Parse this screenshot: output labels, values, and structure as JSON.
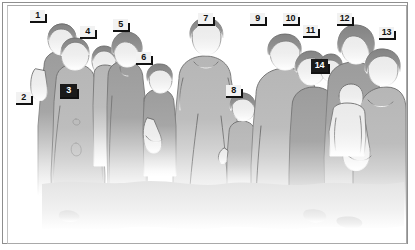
{
  "image": {
    "title": "Group silhouette illustration with numbered callouts",
    "subject": "group-of-people",
    "style": "grayscale-silhouette-line-art",
    "person_count": 14,
    "fade": "figures fade to white toward the bottom of the frame"
  },
  "frame": {
    "outer_border_color": "#8e8e8e",
    "inner_border_color": "#a9a9a9",
    "background_color": "#ffffff"
  },
  "palette": {
    "skin_light": "#e8e8e8",
    "garment_mid": "#b4b4b4",
    "garment_dark": "#9a9a9a",
    "hair_dark": "#7d7d7d",
    "outline": "#5f5f5f",
    "label_plate_light": "#f2f2f2",
    "label_plate_dark": "#1a1a1a",
    "label_text_light": "#111111",
    "label_text_dark": "#ffffff"
  },
  "callouts": [
    {
      "id": 1,
      "label": "1",
      "style": "light",
      "x": 30,
      "y": 10,
      "target": "adult standing at far left, bald/short hair"
    },
    {
      "id": 2,
      "label": "2",
      "style": "light",
      "x": 16,
      "y": 92,
      "target": "torso of far-left adult"
    },
    {
      "id": 3,
      "label": "3",
      "style": "dark",
      "x": 60,
      "y": 84,
      "target": "adult in front centre-left, long garment"
    },
    {
      "id": 4,
      "label": "4",
      "style": "light",
      "x": 80,
      "y": 26,
      "target": "head of person behind, centre-left"
    },
    {
      "id": 5,
      "label": "5",
      "style": "light",
      "x": 113,
      "y": 19,
      "target": "adult with swept-back hair, centre-left"
    },
    {
      "id": 6,
      "label": "6",
      "style": "light",
      "x": 136,
      "y": 52,
      "target": "child held at centre"
    },
    {
      "id": 7,
      "label": "7",
      "style": "light",
      "x": 198,
      "y": 13,
      "target": "tall adult at centre with hair bun"
    },
    {
      "id": 8,
      "label": "8",
      "style": "light",
      "x": 226,
      "y": 85,
      "target": "small child at centre-right"
    },
    {
      "id": 9,
      "label": "9",
      "style": "light",
      "x": 250,
      "y": 13,
      "target": "adult at right group, front left"
    },
    {
      "id": 10,
      "label": "10",
      "style": "light",
      "x": 283,
      "y": 13,
      "target": "adult at right group, second from left"
    },
    {
      "id": 11,
      "label": "11",
      "style": "light",
      "x": 303,
      "y": 25,
      "target": "head partially hidden in right group"
    },
    {
      "id": 12,
      "label": "12",
      "style": "light",
      "x": 337,
      "y": 13,
      "target": "adult at right group with dark hair"
    },
    {
      "id": 13,
      "label": "13",
      "style": "light",
      "x": 379,
      "y": 27,
      "target": "adult at far right holding child"
    },
    {
      "id": 14,
      "label": "14",
      "style": "dark",
      "x": 311,
      "y": 59,
      "target": "infant carried at right"
    }
  ]
}
